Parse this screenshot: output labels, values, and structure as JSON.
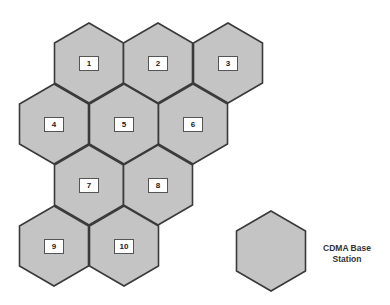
{
  "diagram": {
    "hex_fill": "#c4c4c4",
    "hex_stroke": "#3a3a3a",
    "cells": [
      {
        "id": "1",
        "cx": 89,
        "cy": 63
      },
      {
        "id": "2",
        "cx": 158,
        "cy": 63
      },
      {
        "id": "3",
        "cx": 228,
        "cy": 63
      },
      {
        "id": "4",
        "cx": 54,
        "cy": 124
      },
      {
        "id": "5",
        "cx": 124,
        "cy": 124
      },
      {
        "id": "6",
        "cx": 193,
        "cy": 124
      },
      {
        "id": "7",
        "cx": 89,
        "cy": 185
      },
      {
        "id": "8",
        "cx": 158,
        "cy": 185
      },
      {
        "id": "9",
        "cx": 54,
        "cy": 246
      },
      {
        "id": "10",
        "cx": 124,
        "cy": 246
      }
    ],
    "legend": {
      "label_line1": "CDMA Base",
      "label_line2": "Station",
      "cx": 271,
      "cy": 251
    }
  }
}
